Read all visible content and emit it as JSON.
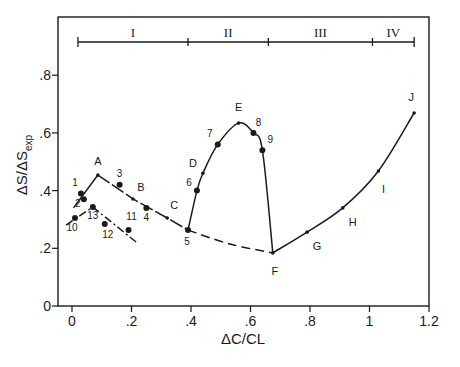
{
  "chart_data": {
    "type": "line",
    "title": "",
    "xlabel": "ΔC/CL",
    "ylabel": "ΔS/ΔS",
    "ylabel_subscript": "exp",
    "xlim": [
      -0.05,
      1.2
    ],
    "ylim": [
      0,
      0.9
    ],
    "x_ticks": [
      0,
      0.2,
      0.4,
      0.6,
      0.8,
      1.0,
      1.2
    ],
    "x_tick_labels": [
      "0",
      ".2",
      ".4",
      ".6",
      ".8",
      "1",
      "1.2"
    ],
    "y_ticks": [
      0,
      0.2,
      0.4,
      0.6,
      0.8
    ],
    "y_tick_labels": [
      "0",
      ".2",
      ".4",
      ".6",
      ".8"
    ],
    "grid": false,
    "legend": null,
    "regions": [
      {
        "label": "I",
        "x_start": 0.02,
        "x_end": 0.39
      },
      {
        "label": "II",
        "x_start": 0.39,
        "x_end": 0.66
      },
      {
        "label": "III",
        "x_start": 0.66,
        "x_end": 1.01
      },
      {
        "label": "IV",
        "x_start": 1.01,
        "x_end": 1.15
      }
    ],
    "series": [
      {
        "name": "main-curve-rise-1",
        "style": "solid",
        "points": [
          [
            0.005,
            0.34
          ],
          [
            0.087,
            0.454
          ]
        ]
      },
      {
        "name": "main-curve-fall-1",
        "style": "long-dash",
        "points": [
          [
            0.087,
            0.454
          ],
          [
            0.205,
            0.371
          ],
          [
            0.32,
            0.305
          ],
          [
            0.39,
            0.263
          ]
        ]
      },
      {
        "name": "lower-branch",
        "style": "dash-dot",
        "points": [
          [
            -0.02,
            0.28
          ],
          [
            0.07,
            0.343
          ],
          [
            0.22,
            0.218
          ]
        ]
      },
      {
        "name": "loop-II",
        "style": "solid",
        "points": [
          [
            0.39,
            0.263
          ],
          [
            0.42,
            0.4
          ],
          [
            0.44,
            0.46
          ],
          [
            0.49,
            0.56
          ],
          [
            0.56,
            0.634
          ],
          [
            0.61,
            0.6
          ],
          [
            0.64,
            0.54
          ],
          [
            0.675,
            0.184
          ]
        ]
      },
      {
        "name": "baseline-dashed",
        "style": "dashed",
        "points": [
          [
            0.39,
            0.263
          ],
          [
            0.53,
            0.215
          ],
          [
            0.675,
            0.184
          ]
        ]
      },
      {
        "name": "rise-III-IV",
        "style": "solid",
        "points": [
          [
            0.675,
            0.184
          ],
          [
            0.79,
            0.256
          ],
          [
            0.91,
            0.34
          ],
          [
            1.03,
            0.468
          ],
          [
            1.15,
            0.669
          ]
        ]
      }
    ],
    "labeled_points": [
      {
        "label": "A",
        "x": 0.087,
        "y": 0.454,
        "marker": "plus"
      },
      {
        "label": "B",
        "x": 0.205,
        "y": 0.371,
        "marker": "plus"
      },
      {
        "label": "C",
        "x": 0.32,
        "y": 0.305,
        "marker": "plus"
      },
      {
        "label": "D",
        "x": 0.44,
        "y": 0.46,
        "marker": "plus"
      },
      {
        "label": "E",
        "x": 0.56,
        "y": 0.634,
        "marker": "plus"
      },
      {
        "label": "F",
        "x": 0.675,
        "y": 0.184,
        "marker": "plus"
      },
      {
        "label": "G",
        "x": 0.79,
        "y": 0.256,
        "marker": "plus"
      },
      {
        "label": "H",
        "x": 0.91,
        "y": 0.34,
        "marker": "plus"
      },
      {
        "label": "I",
        "x": 1.03,
        "y": 0.468,
        "marker": "plus"
      },
      {
        "label": "J",
        "x": 1.15,
        "y": 0.669,
        "marker": "plus"
      }
    ],
    "numbered_points": [
      {
        "label": "1",
        "x": 0.03,
        "y": 0.39
      },
      {
        "label": "2",
        "x": 0.04,
        "y": 0.37
      },
      {
        "label": "3",
        "x": 0.16,
        "y": 0.42
      },
      {
        "label": "4",
        "x": 0.25,
        "y": 0.34
      },
      {
        "label": "5",
        "x": 0.39,
        "y": 0.263
      },
      {
        "label": "6",
        "x": 0.42,
        "y": 0.4
      },
      {
        "label": "7",
        "x": 0.49,
        "y": 0.56
      },
      {
        "label": "8",
        "x": 0.61,
        "y": 0.6
      },
      {
        "label": "9",
        "x": 0.64,
        "y": 0.54
      },
      {
        "label": "10",
        "x": 0.01,
        "y": 0.305
      },
      {
        "label": "11",
        "x": 0.19,
        "y": 0.263
      },
      {
        "label": "12",
        "x": 0.11,
        "y": 0.284
      },
      {
        "label": "13",
        "x": 0.07,
        "y": 0.343
      }
    ]
  },
  "layout": {
    "plot_left": 58,
    "plot_top": 17,
    "plot_right": 429,
    "plot_bottom": 306,
    "x0_px": 72,
    "px_per_x": 297.5,
    "y0_px": 306,
    "px_per_y": 288.5,
    "region_bar_y": 42
  },
  "label_offsets": {
    "A": [
      0,
      -10
    ],
    "B": [
      8,
      -8
    ],
    "C": [
      7,
      -9
    ],
    "D": [
      -10,
      -6
    ],
    "E": [
      0,
      -12
    ],
    "F": [
      2,
      22
    ],
    "G": [
      10,
      18
    ],
    "H": [
      10,
      18
    ],
    "I": [
      5,
      22
    ],
    "J": [
      -3,
      -12
    ],
    "1": [
      -6,
      -7
    ],
    "2": [
      -6,
      8
    ],
    "3": [
      0,
      -8
    ],
    "4": [
      0,
      13
    ],
    "5": [
      -1,
      15
    ],
    "6": [
      -8,
      -5
    ],
    "7": [
      -8,
      -7
    ],
    "8": [
      5,
      -7
    ],
    "9": [
      8,
      -7
    ],
    "10": [
      -3,
      13
    ],
    "11": [
      3,
      -10
    ],
    "12": [
      3,
      14
    ],
    "13": [
      0,
      12
    ]
  }
}
